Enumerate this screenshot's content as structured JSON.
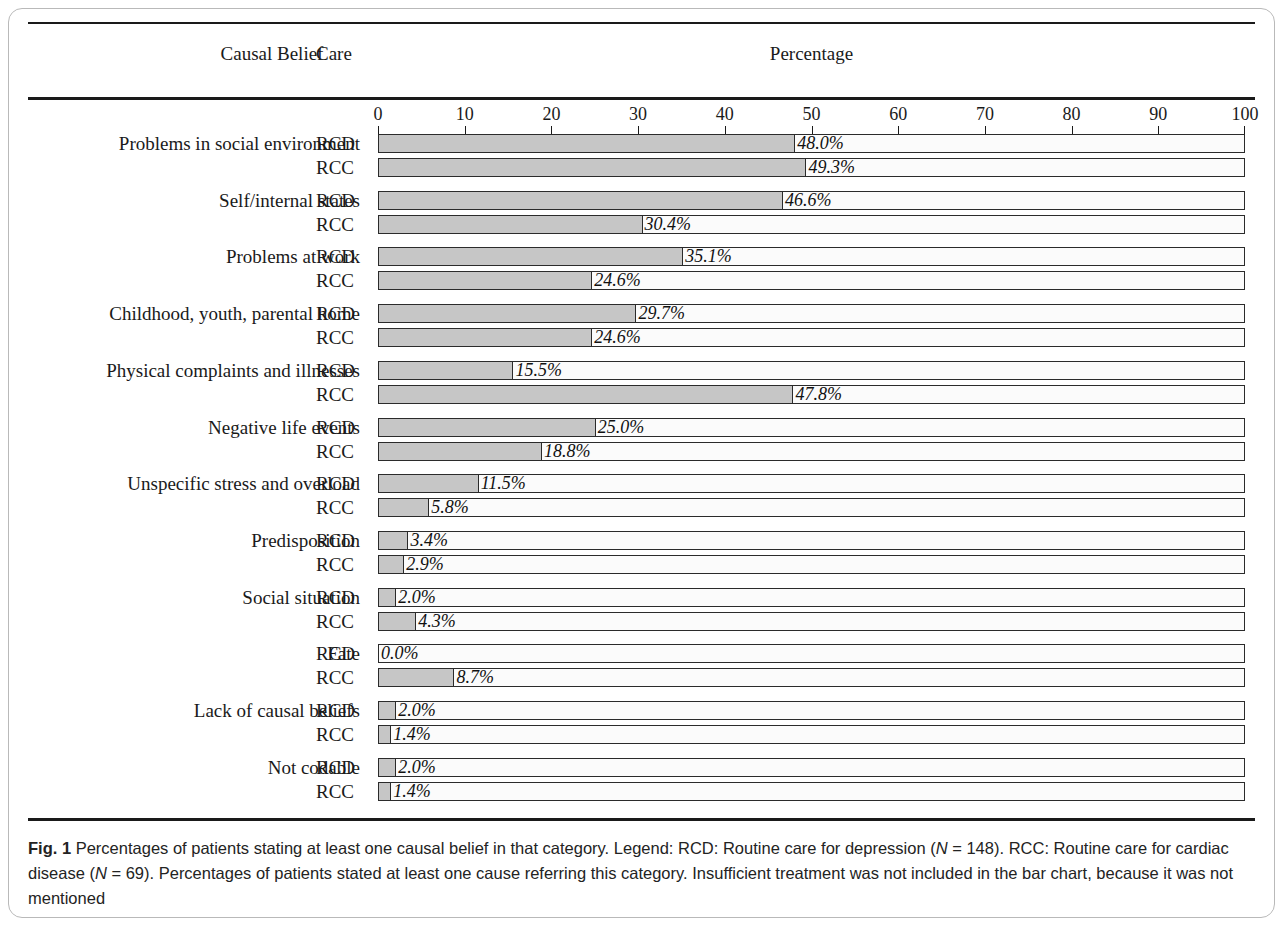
{
  "header": {
    "causal_belief": "Causal Belief",
    "care": "Care",
    "percentage": "Percentage"
  },
  "caption": {
    "figure_label": "Fig. 1",
    "text_1": " Percentages of patients stating at least one causal belief in that category. Legend: RCD: Routine care for depression (",
    "n_italic_1": "N",
    "text_2": " = 148). RCC: Routine care for cardiac disease (",
    "n_italic_2": "N",
    "text_3": " = 69). Percentages of patients stated at least one cause referring this category. Insufficient treatment was not included in the bar chart, because it was not mentioned"
  },
  "chart_data": {
    "type": "bar",
    "orientation": "horizontal",
    "title": "Percentages of patients stating at least one causal belief in that category",
    "xlabel": "Percentage",
    "ylabel": "Causal Belief",
    "xlim": [
      0,
      100
    ],
    "xticks": [
      0,
      10,
      20,
      30,
      40,
      50,
      60,
      70,
      80,
      90,
      100
    ],
    "xtick_labels": [
      "0",
      "10",
      "20",
      "30",
      "40",
      "50",
      "60",
      "70",
      "80",
      "90",
      "100"
    ],
    "grid": false,
    "legend_position": "none",
    "series_labels": [
      "RCD",
      "RCC"
    ],
    "categories": [
      "Problems in social environment",
      "Self/internal states",
      "Problems at work",
      "Childhood, youth, parental home",
      "Physical complaints and illnesses",
      "Negative life events",
      "Unspecific stress and overload",
      "Predisposition",
      "Social situation",
      "Fate",
      "Lack of causal beliefs",
      "Not codable"
    ],
    "series": [
      {
        "name": "RCD",
        "values": [
          48.0,
          46.6,
          35.1,
          29.7,
          15.5,
          25.0,
          11.5,
          3.4,
          2.0,
          0.0,
          2.0,
          2.0
        ],
        "labels": [
          "48.0%",
          "46.6%",
          "35.1%",
          "29.7%",
          "15.5%",
          "25.0%",
          "11.5%",
          "3.4%",
          "2.0%",
          "0.0%",
          "2.0%",
          "2.0%"
        ]
      },
      {
        "name": "RCC",
        "values": [
          49.3,
          30.4,
          24.6,
          24.6,
          47.8,
          18.8,
          5.8,
          2.9,
          4.3,
          8.7,
          1.4,
          1.4
        ],
        "labels": [
          "49.3%",
          "30.4%",
          "24.6%",
          "24.6%",
          "47.8%",
          "18.8%",
          "5.8%",
          "2.9%",
          "4.3%",
          "8.7%",
          "1.4%",
          "1.4%"
        ]
      }
    ],
    "bar_fill_color": "#c6c6c6",
    "bar_border_color": "#2b2b2b",
    "track_color": "#fbfbfb"
  }
}
